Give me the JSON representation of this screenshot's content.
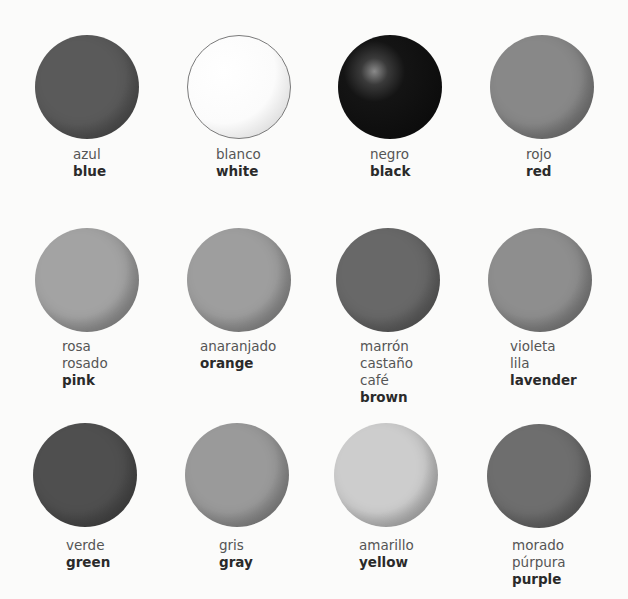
{
  "colors": [
    {
      "spanish": [
        "azul"
      ],
      "english": "blue",
      "shade": "#5a5a5a",
      "circle": {
        "x": 35,
        "y": 35
      },
      "label": {
        "x": 73,
        "y": 146
      },
      "style": "matte"
    },
    {
      "spanish": [
        "blanco"
      ],
      "english": "white",
      "shade": "#fdfdfd",
      "circle": {
        "x": 187,
        "y": 35
      },
      "label": {
        "x": 216,
        "y": 146
      },
      "style": "outlined"
    },
    {
      "spanish": [
        "negro"
      ],
      "english": "black",
      "shade": "#111111",
      "circle": {
        "x": 338,
        "y": 35
      },
      "label": {
        "x": 370,
        "y": 146
      },
      "style": "highlight"
    },
    {
      "spanish": [
        "rojo"
      ],
      "english": "red",
      "shade": "#888888",
      "circle": {
        "x": 490,
        "y": 35
      },
      "label": {
        "x": 526,
        "y": 146
      },
      "style": "matte"
    },
    {
      "spanish": [
        "rosa",
        "rosado"
      ],
      "english": "pink",
      "shade": "#a3a3a3",
      "circle": {
        "x": 35,
        "y": 228
      },
      "label": {
        "x": 62,
        "y": 338
      },
      "style": "matte"
    },
    {
      "spanish": [
        "anaranjado"
      ],
      "english": "orange",
      "shade": "#9e9e9e",
      "circle": {
        "x": 187,
        "y": 228
      },
      "label": {
        "x": 200,
        "y": 338
      },
      "style": "matte"
    },
    {
      "spanish": [
        "marrón",
        "castaño",
        "café"
      ],
      "english": "brown",
      "shade": "#686868",
      "circle": {
        "x": 336,
        "y": 228
      },
      "label": {
        "x": 360,
        "y": 338
      },
      "style": "matte"
    },
    {
      "spanish": [
        "violeta",
        "lila"
      ],
      "english": "lavender",
      "shade": "#8e8e8e",
      "circle": {
        "x": 488,
        "y": 228
      },
      "label": {
        "x": 510,
        "y": 338
      },
      "style": "matte"
    },
    {
      "spanish": [
        "verde"
      ],
      "english": "green",
      "shade": "#4f4f4f",
      "circle": {
        "x": 33,
        "y": 423
      },
      "label": {
        "x": 66,
        "y": 537
      },
      "style": "matte"
    },
    {
      "spanish": [
        "gris"
      ],
      "english": "gray",
      "shade": "#9a9a9a",
      "circle": {
        "x": 185,
        "y": 423
      },
      "label": {
        "x": 219,
        "y": 537
      },
      "style": "matte"
    },
    {
      "spanish": [
        "amarillo"
      ],
      "english": "yellow",
      "shade": "#cdcdcd",
      "circle": {
        "x": 334,
        "y": 423
      },
      "label": {
        "x": 359,
        "y": 537
      },
      "style": "matte"
    },
    {
      "spanish": [
        "morado",
        "púrpura"
      ],
      "english": "purple",
      "shade": "#6e6e6e",
      "circle": {
        "x": 487,
        "y": 424
      },
      "label": {
        "x": 512,
        "y": 537
      },
      "style": "matte"
    }
  ]
}
